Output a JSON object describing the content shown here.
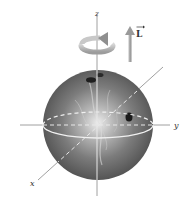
{
  "diagram": {
    "axes": {
      "x_label": "x",
      "y_label": "y",
      "z_label": "z"
    },
    "vector": {
      "label": "L",
      "has_arrow_overbar": true,
      "direction": "+z"
    },
    "rotation_indicator": "counterclockwise curved arrow around z-axis",
    "colors": {
      "sphere_dark": "#5a5a5a",
      "sphere_light": "#e8e8e8",
      "axis": "#9a9a9a",
      "equator": "#f0f0f0",
      "arrow": "#a8a8a8",
      "text": "#333333"
    }
  }
}
